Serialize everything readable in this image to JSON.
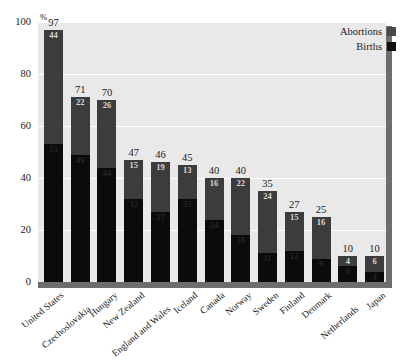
{
  "chart_data": {
    "type": "bar",
    "subtype": "stacked-bar",
    "title": "",
    "subtitle": "",
    "xlabel": "",
    "ylabel": "",
    "y_unit": "%",
    "ylim": [
      0,
      100
    ],
    "yticks": [
      0,
      20,
      40,
      60,
      80,
      100
    ],
    "ytick_labels": [
      "0",
      "20",
      "40",
      "60",
      "80",
      "100"
    ],
    "grid": true,
    "grid_orientation": "horizontal",
    "legend_position": "top-right",
    "legend": [
      "Abortions",
      "Births"
    ],
    "categories": [
      "United States",
      "Czechoslovakia",
      "Hungary",
      "New Zealand",
      "England and Wales",
      "Iceland",
      "Canada",
      "Norway",
      "Sweden",
      "Finland",
      "Denmark",
      "Netherlands",
      "Japan"
    ],
    "series": [
      {
        "name": "Births",
        "color": "#0b0b0b",
        "values": [
          53,
          49,
          44,
          32,
          27,
          32,
          24,
          18,
          11,
          12,
          9,
          6,
          4
        ]
      },
      {
        "name": "Abortions",
        "color": "#3c3c3c",
        "values": [
          44,
          22,
          26,
          15,
          19,
          13,
          16,
          22,
          24,
          15,
          16,
          4,
          6
        ]
      }
    ],
    "totals": [
      97,
      71,
      70,
      47,
      46,
      45,
      40,
      40,
      35,
      27,
      25,
      10,
      10
    ],
    "abortion_labels": [
      "44",
      "22",
      "26",
      "15",
      "19",
      "13",
      "16",
      "22",
      "24",
      "15",
      "16",
      "4",
      "6"
    ],
    "birth_labels": [
      "53",
      "49",
      "44",
      "32",
      "27",
      "32",
      "24",
      "18",
      "11",
      "12",
      "9",
      "6",
      "4"
    ],
    "total_labels": [
      "97",
      "71",
      "70",
      "47",
      "46",
      "45",
      "40",
      "40",
      "35",
      "27",
      "25",
      "10",
      "10"
    ]
  },
  "colors": {
    "plot_background": "#e9e9e9",
    "page_background": "#ffffff",
    "gridline": "#ffffff",
    "frame_shadow": "#6d6d6d",
    "abortions": "#3c3c3c",
    "births": "#0b0b0b",
    "text": "#1a1a1a"
  },
  "axis": {
    "percent_symbol": "%"
  }
}
